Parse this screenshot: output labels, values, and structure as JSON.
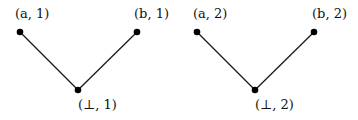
{
  "diagram": {
    "type": "hasse-diagram",
    "components": [
      {
        "id": "poset-1",
        "nodes": [
          {
            "id": "a1",
            "label": "(a, 1)",
            "x": 20,
            "y": 32,
            "lx": 15,
            "ly": 18
          },
          {
            "id": "b1",
            "label": "(b, 1)",
            "x": 137,
            "y": 32,
            "lx": 134,
            "ly": 18
          },
          {
            "id": "bot1",
            "label": "(⊥, 1)",
            "x": 78,
            "y": 90,
            "lx": 78,
            "ly": 108
          }
        ],
        "edges": [
          {
            "from": "a1",
            "to": "bot1"
          },
          {
            "from": "b1",
            "to": "bot1"
          }
        ]
      },
      {
        "id": "poset-2",
        "nodes": [
          {
            "id": "a2",
            "label": "(a, 2)",
            "x": 197,
            "y": 32,
            "lx": 193,
            "ly": 18
          },
          {
            "id": "b2",
            "label": "(b, 2)",
            "x": 314,
            "y": 32,
            "lx": 312,
            "ly": 18
          },
          {
            "id": "bot2",
            "label": "(⊥, 2)",
            "x": 255,
            "y": 90,
            "lx": 255,
            "ly": 108
          }
        ],
        "edges": [
          {
            "from": "a2",
            "to": "bot2"
          },
          {
            "from": "b2",
            "to": "bot2"
          }
        ]
      }
    ],
    "colors": {
      "node": "#000000",
      "edge": "#1a1a1a",
      "text": "#111111",
      "background": "#ffffff"
    }
  }
}
